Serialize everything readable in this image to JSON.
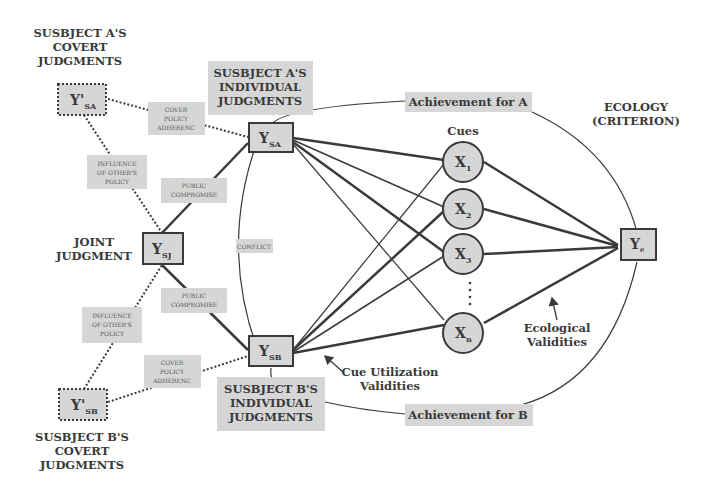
{
  "diagram": {
    "title_blocks": {
      "subject_a_covert": [
        "SUSBJECT A'S",
        "COVERT",
        "JUDGMENTS"
      ],
      "subject_b_covert": [
        "SUSBJECT B'S",
        "COVERT",
        "JUDGMENTS"
      ],
      "joint": [
        "JOINT",
        "JUDGMENT"
      ],
      "subject_a_individual": [
        "SUSBJECT A'S",
        "INDIVIDUAL",
        "JUDGMENTS"
      ],
      "subject_b_individual": [
        "SUSBJECT B'S",
        "INDIVIDUAL",
        "JUDGMENTS"
      ],
      "ecology": [
        "ECOLOGY",
        "(CRITERION)"
      ]
    },
    "nodes": {
      "y_prime_sa": {
        "main": "Y'",
        "sub": "SA"
      },
      "y_prime_sb": {
        "main": "Y'",
        "sub": "SB"
      },
      "y_sj": {
        "main": "Y",
        "sub": "SJ"
      },
      "y_sa": {
        "main": "Y",
        "sub": "SA"
      },
      "y_sb": {
        "main": "Y",
        "sub": "SB"
      },
      "y_e": {
        "main": "Y",
        "sub": "e"
      },
      "cues": [
        {
          "main": "X",
          "sub": "1"
        },
        {
          "main": "X",
          "sub": "2"
        },
        {
          "main": "X",
          "sub": "3"
        },
        {
          "main": "X",
          "sub": "n"
        }
      ]
    },
    "edge_labels": {
      "cover_policy_a": [
        "COVER",
        "POLICY",
        "ADHERENC"
      ],
      "cover_policy_b": [
        "COVER",
        "POLICY",
        "ADHERENC"
      ],
      "influence_a": [
        "INFLUENCE",
        "OF OTHER'S",
        "POLICY"
      ],
      "influence_b": [
        "INFLUENCE",
        "OF OTHER'S",
        "POLICY"
      ],
      "public_compromise_a": [
        "PUBLIC",
        "COMPROMISE"
      ],
      "public_compromise_b": [
        "PUBLIC",
        "COMPROMISE"
      ],
      "conflict": "CONFLICT",
      "achievement_a": "Achievement for A",
      "achievement_b": "Achievement for B",
      "cues_header": "Cues",
      "cue_utilization": [
        "Cue Utilization",
        "Validities"
      ],
      "ecological_validities": [
        "Ecological",
        "Validities"
      ]
    },
    "colors": {
      "box_fill": "#d6d6d6",
      "stroke": "#3a3a3a",
      "text": "#3a3a3a"
    }
  }
}
